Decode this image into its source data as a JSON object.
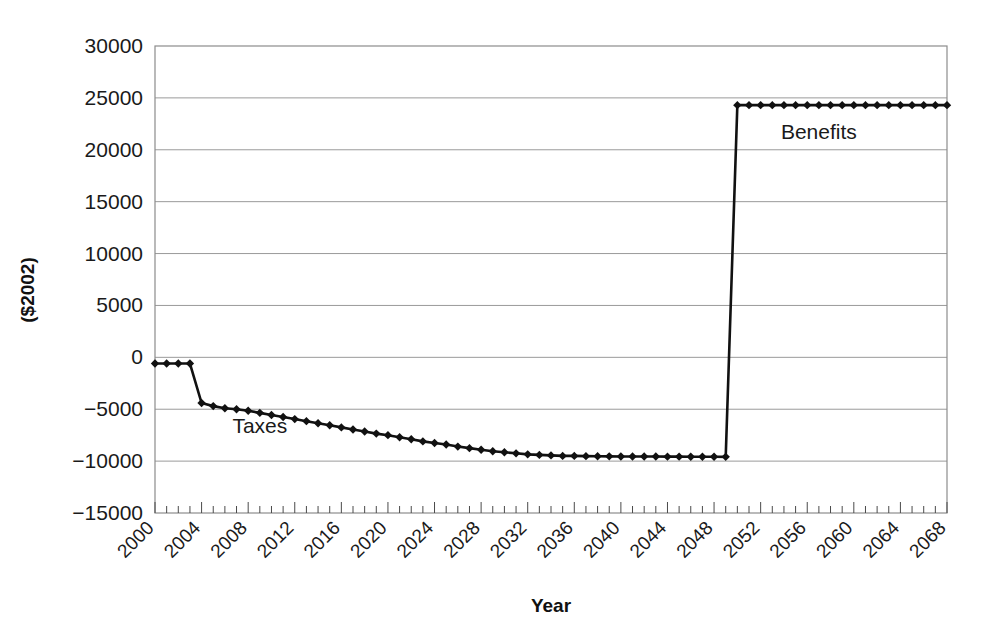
{
  "chart_data": {
    "type": "line",
    "title": "",
    "xlabel": "Year",
    "ylabel": "($2002)",
    "xlim": [
      2000,
      2068
    ],
    "ylim": [
      -15000,
      30000
    ],
    "grid": true,
    "legend": "inline-annotations",
    "y_ticks": [
      "30000",
      "25000",
      "20000",
      "15000",
      "10000",
      "5000",
      "0",
      "−5000",
      "−10000",
      "−15000"
    ],
    "y_tick_values": [
      30000,
      25000,
      20000,
      15000,
      10000,
      5000,
      0,
      -5000,
      -10000,
      -15000
    ],
    "x_ticks": [
      "2000",
      "2004",
      "2008",
      "2012",
      "2016",
      "2020",
      "2024",
      "2028",
      "2032",
      "2036",
      "2040",
      "2044",
      "2048",
      "2052",
      "2056",
      "2060",
      "2064",
      "2068"
    ],
    "x_tick_values": [
      2000,
      2004,
      2008,
      2012,
      2016,
      2020,
      2024,
      2028,
      2032,
      2036,
      2040,
      2044,
      2048,
      2052,
      2056,
      2060,
      2064,
      2068
    ],
    "x_minor_step": 1,
    "annotations": [
      {
        "text": "Taxes",
        "x": 2009,
        "y": -7300
      },
      {
        "text": "Benefits",
        "x": 2057,
        "y": 21000
      }
    ],
    "series": [
      {
        "name": "Taxes and Benefits",
        "marker": "diamond",
        "color": "#111111",
        "x": [
          2000,
          2001,
          2002,
          2003,
          2004,
          2005,
          2006,
          2007,
          2008,
          2009,
          2010,
          2011,
          2012,
          2013,
          2014,
          2015,
          2016,
          2017,
          2018,
          2019,
          2020,
          2021,
          2022,
          2023,
          2024,
          2025,
          2026,
          2027,
          2028,
          2029,
          2030,
          2031,
          2032,
          2033,
          2034,
          2035,
          2036,
          2037,
          2038,
          2039,
          2040,
          2041,
          2042,
          2043,
          2044,
          2045,
          2046,
          2047,
          2048,
          2049,
          2050,
          2051,
          2052,
          2053,
          2054,
          2055,
          2056,
          2057,
          2058,
          2059,
          2060,
          2061,
          2062,
          2063,
          2064,
          2065,
          2066,
          2067,
          2068
        ],
        "values": [
          -600,
          -600,
          -600,
          -600,
          -4400,
          -4700,
          -4900,
          -5000,
          -5150,
          -5350,
          -5550,
          -5750,
          -5950,
          -6150,
          -6350,
          -6550,
          -6750,
          -6950,
          -7150,
          -7350,
          -7500,
          -7700,
          -7900,
          -8100,
          -8250,
          -8400,
          -8600,
          -8750,
          -8900,
          -9050,
          -9150,
          -9250,
          -9350,
          -9400,
          -9450,
          -9500,
          -9500,
          -9520,
          -9530,
          -9540,
          -9550,
          -9550,
          -9560,
          -9560,
          -9570,
          -9570,
          -9580,
          -9580,
          -9580,
          -9590,
          24300,
          24300,
          24300,
          24300,
          24300,
          24300,
          24300,
          24300,
          24300,
          24300,
          24300,
          24300,
          24300,
          24300,
          24300,
          24300,
          24300,
          24300,
          24300
        ]
      }
    ]
  },
  "axes": {
    "x_title": "Year",
    "y_title": "($2002)"
  }
}
